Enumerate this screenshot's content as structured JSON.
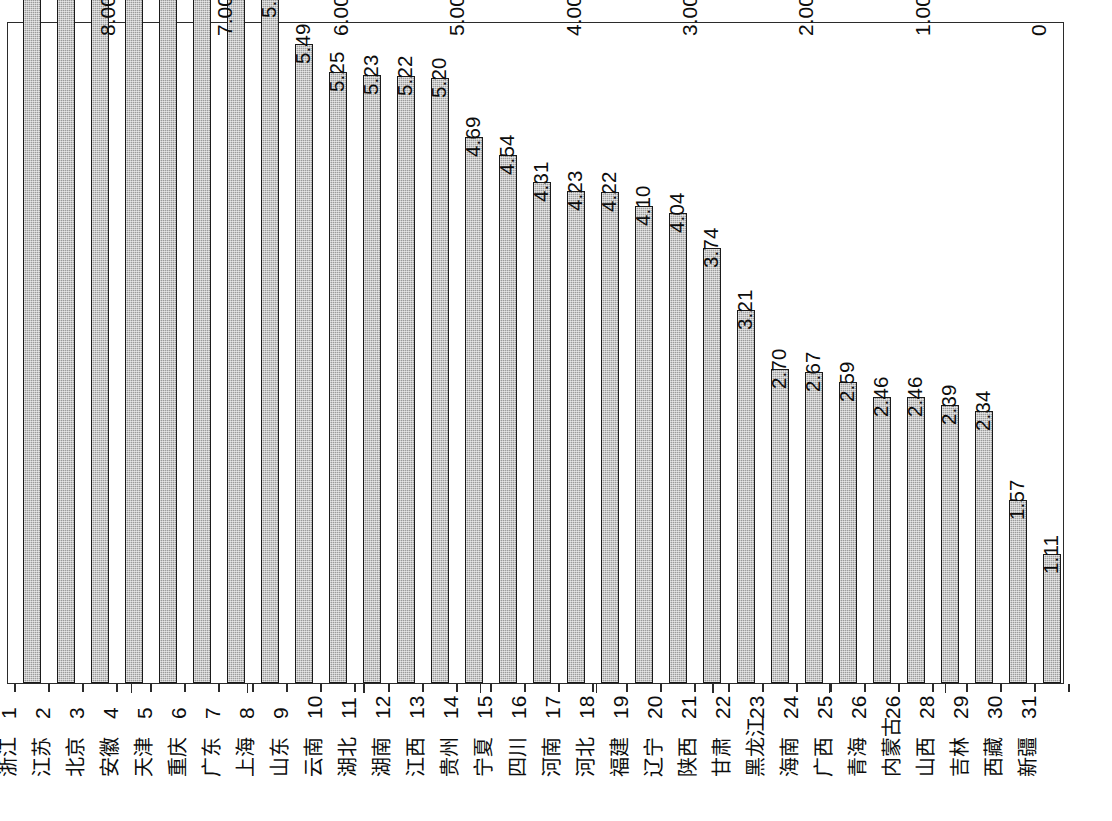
{
  "chart_data": {
    "type": "bar",
    "title": "",
    "subtitle": "",
    "xlabel": "",
    "ylabel": "",
    "orientation": "rotated-90",
    "grid": false,
    "legend": null,
    "ylim": [
      0,
      9
    ],
    "ytick_labels": [
      "0",
      "1.00",
      "2.00",
      "3.00",
      "4.00",
      "5.00",
      "6.00",
      "7.00",
      "8.00",
      "9.00"
    ],
    "ytick_values": [
      0,
      1,
      2,
      3,
      4,
      5,
      6,
      7,
      8,
      9
    ],
    "categories": [
      "浙江",
      "江苏",
      "北京",
      "安徽",
      "天津",
      "重庆",
      "广东",
      "上海",
      "山东",
      "云南",
      "湖北",
      "湖南",
      "江西",
      "贵州",
      "宁夏",
      "四川",
      "河南",
      "河北",
      "福建",
      "辽宁",
      "陕西",
      "甘肃",
      "黑龙江",
      "海南",
      "广西",
      "青海",
      "内蒙古",
      "山西",
      "吉林",
      "西藏",
      "新疆"
    ],
    "rank_labels": [
      "1",
      "2",
      "3",
      "4",
      "5",
      "6",
      "7",
      "8",
      "9",
      "10",
      "11",
      "12",
      "13",
      "14",
      "15",
      "16",
      "17",
      "18",
      "19",
      "20",
      "21",
      "22",
      "23",
      "24",
      "25",
      "26",
      "26",
      "28",
      "29",
      "30",
      "31"
    ],
    "values": [
      8.46,
      8.19,
      7.54,
      6.87,
      6.74,
      6.37,
      6.05,
      5.89,
      5.49,
      5.25,
      5.23,
      5.22,
      5.2,
      4.69,
      4.54,
      4.31,
      4.23,
      4.22,
      4.1,
      4.04,
      3.74,
      3.21,
      2.7,
      2.67,
      2.59,
      2.46,
      2.46,
      2.39,
      2.34,
      1.57,
      1.11
    ],
    "value_labels": [
      "8.46",
      "8.19",
      "7.54",
      "6.87",
      "6.74",
      "6.37",
      "6.05",
      "5.89",
      "5.49",
      "5.25",
      "5.23",
      "5.22",
      "5.20",
      "4.69",
      "4.54",
      "4.31",
      "4.23",
      "4.22",
      "4.10",
      "4.04",
      "3.74",
      "3.21",
      "2.70",
      "2.67",
      "2.59",
      "2.46",
      "2.46",
      "2.39",
      "2.34",
      "1.57",
      "1.11"
    ],
    "colors": {
      "bar_fill": "#9a9a9a",
      "bar_border": "#1a1a1a",
      "axis": "#2b2b2b",
      "text": "#0d0d0d",
      "background": "#ffffff"
    }
  }
}
